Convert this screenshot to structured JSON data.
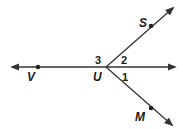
{
  "diagram": {
    "type": "rays-from-point",
    "vertex": {
      "label": "U",
      "x": 106,
      "y": 67
    },
    "points": [
      {
        "label": "V",
        "x": 38,
        "y": 67
      },
      {
        "label": "S",
        "x": 151,
        "y": 26
      },
      {
        "label": "M",
        "x": 151,
        "y": 108
      }
    ],
    "angles": [
      {
        "label": "1",
        "x": 124,
        "y": 80
      },
      {
        "label": "2",
        "x": 124,
        "y": 64
      },
      {
        "label": "3",
        "x": 97,
        "y": 64
      }
    ],
    "colors": {
      "line": "#333333",
      "text": "#1a1a1a"
    }
  }
}
